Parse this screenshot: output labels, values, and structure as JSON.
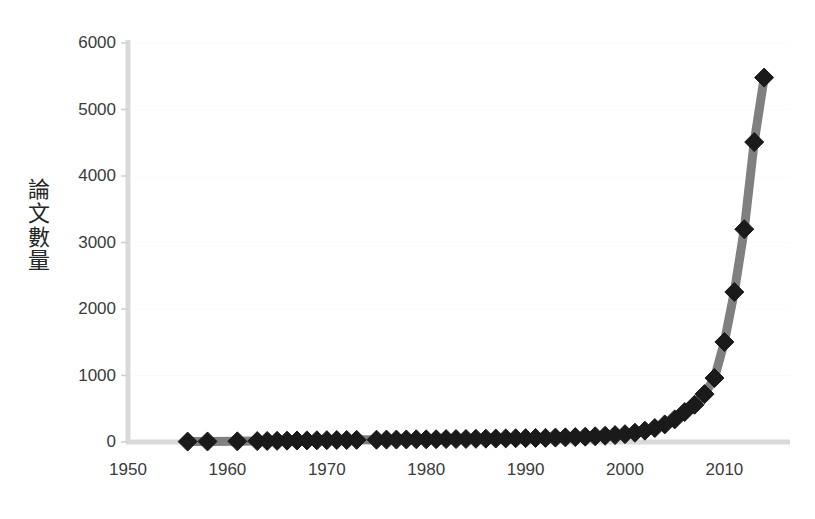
{
  "chart_data": {
    "type": "line",
    "title": "",
    "subtitle": "",
    "xlabel": "",
    "ylabel": "論文數量",
    "xlim": [
      1950,
      2016.6
    ],
    "ylim": [
      0,
      6000
    ],
    "xticks": [
      1950,
      1960,
      1970,
      1980,
      1990,
      2000,
      2010
    ],
    "xtick_labels": [
      "1950",
      "1960",
      "1970",
      "1980",
      "1990",
      "2000",
      "2010"
    ],
    "yticks": [
      0,
      1000,
      2000,
      3000,
      4000,
      5000,
      6000
    ],
    "ytick_labels": [
      "0",
      "1000",
      "2000",
      "3000",
      "4000",
      "5000",
      "6000"
    ],
    "grid": false,
    "legend": null,
    "marker": "diamond",
    "marker_color": "#1a1a1a",
    "line_color": "#808080",
    "axis_color": "#d9d9d9",
    "series": [
      {
        "name": "論文數量",
        "x": [
          1956,
          1958,
          1961,
          1963,
          1964,
          1965,
          1966,
          1967,
          1968,
          1969,
          1970,
          1971,
          1972,
          1973,
          1975,
          1976,
          1977,
          1978,
          1979,
          1980,
          1981,
          1982,
          1983,
          1984,
          1985,
          1986,
          1987,
          1988,
          1989,
          1990,
          1991,
          1992,
          1993,
          1994,
          1995,
          1996,
          1997,
          1998,
          1999,
          2000,
          2001,
          2002,
          2003,
          2004,
          2005,
          2006,
          2007,
          2008,
          2009,
          2010,
          2011,
          2012,
          2013,
          2014
        ],
        "y": [
          6,
          8,
          10,
          14,
          16,
          18,
          20,
          22,
          24,
          26,
          28,
          30,
          30,
          32,
          34,
          36,
          36,
          38,
          40,
          40,
          42,
          44,
          44,
          46,
          48,
          50,
          52,
          54,
          56,
          58,
          60,
          62,
          66,
          70,
          74,
          80,
          86,
          94,
          104,
          118,
          140,
          170,
          210,
          265,
          340,
          450,
          560,
          720,
          962,
          1504,
          2256,
          3200,
          4510,
          5480
        ]
      }
    ]
  },
  "axes": {
    "y_axis_name": "y-axis",
    "x_axis_name": "x-axis"
  }
}
